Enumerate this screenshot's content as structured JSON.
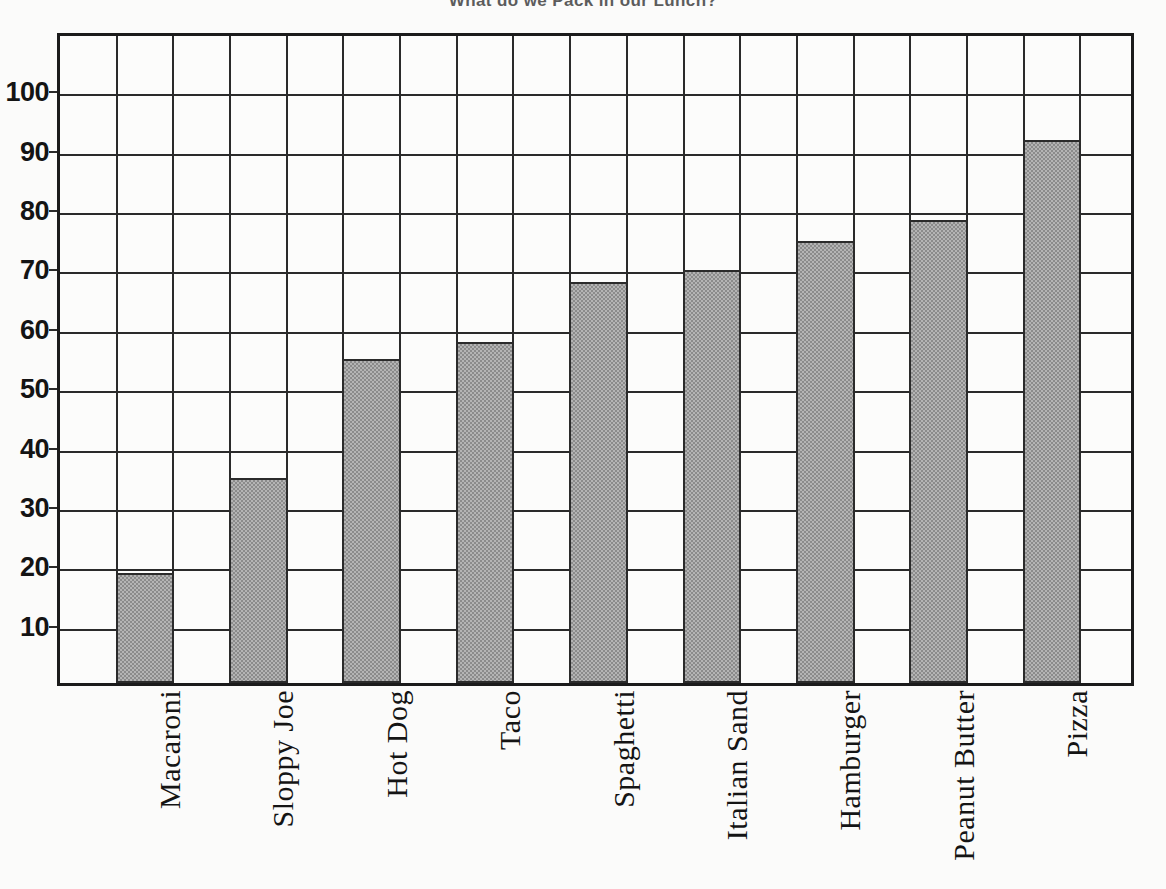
{
  "chart_data": {
    "type": "bar",
    "title": "What do we Pack in our Lunch?",
    "xlabel": "",
    "ylabel": "",
    "categories": [
      "Macaroni",
      "Sloppy Joe",
      "Hot Dog",
      "Taco",
      "Spaghetti",
      "Italian Sand",
      "Hamburger",
      "Peanut Butter",
      "Pizza"
    ],
    "values": [
      18.5,
      34.5,
      54.5,
      57.5,
      67.5,
      69.5,
      74.5,
      78,
      91.5
    ],
    "ylim": [
      0,
      110
    ],
    "yticks": [
      10,
      20,
      30,
      40,
      50,
      60,
      70,
      80,
      90,
      100
    ],
    "grid": true,
    "legend": "none",
    "bar_fill": "#b4b4b4",
    "bar_edge": "#2b2b2b",
    "axis_color": "#1b1b1b"
  },
  "axis": {
    "ytick_labels": [
      "100",
      "90",
      "80",
      "70",
      "60",
      "50",
      "40",
      "30",
      "20",
      "10"
    ]
  }
}
